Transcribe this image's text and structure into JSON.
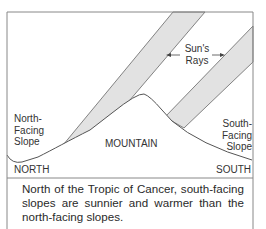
{
  "diagram": {
    "labels": {
      "suns_rays": "Sun's Rays",
      "suns_rays_line1": "Sun's",
      "suns_rays_line2": "Rays",
      "north_facing_slope_line1": "North-",
      "north_facing_slope_line2": "Facing",
      "north_facing_slope_line3": "Slope",
      "south_facing_slope_line1": "South-",
      "south_facing_slope_line2": "Facing",
      "south_facing_slope_line3": "Slope",
      "mountain": "MOUNTAIN",
      "north": "NORTH",
      "south": "SOUTH"
    },
    "caption": "North of the Tropic of Cancer, south-facing slopes are sunnier and warmer than the north-facing slopes.",
    "colors": {
      "ray_fill": "#e2e2e2",
      "line": "#555555",
      "frame": "#888888"
    }
  }
}
